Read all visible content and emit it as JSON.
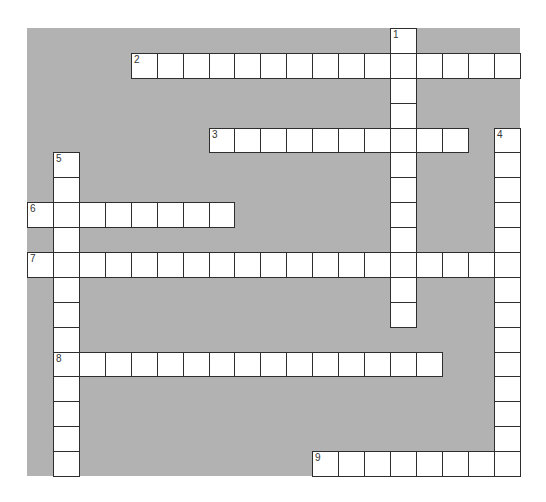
{
  "puzzle": {
    "type": "crossword",
    "grid": {
      "cols": 19,
      "rows": 18,
      "left": 27,
      "top": 28,
      "cell_width": 25.93,
      "cell_height": 24.89,
      "background_color": "#b2b2b2",
      "cell_color": "#ffffff",
      "border_color": "#2e2e2e",
      "number_color": "#333333"
    },
    "entries": [
      {
        "number": "1",
        "direction": "down",
        "row": 0,
        "col": 14,
        "length": 12
      },
      {
        "number": "2",
        "direction": "across",
        "row": 1,
        "col": 4,
        "length": 15
      },
      {
        "number": "3",
        "direction": "across",
        "row": 4,
        "col": 7,
        "length": 10
      },
      {
        "number": "4",
        "direction": "down",
        "row": 4,
        "col": 18,
        "length": 14
      },
      {
        "number": "5",
        "direction": "down",
        "row": 5,
        "col": 1,
        "length": 13
      },
      {
        "number": "6",
        "direction": "across",
        "row": 7,
        "col": 0,
        "length": 8
      },
      {
        "number": "7",
        "direction": "across",
        "row": 9,
        "col": 0,
        "length": 19
      },
      {
        "number": "8",
        "direction": "across",
        "row": 13,
        "col": 1,
        "length": 15
      },
      {
        "number": "9",
        "direction": "across",
        "row": 17,
        "col": 11,
        "length": 8
      }
    ]
  }
}
